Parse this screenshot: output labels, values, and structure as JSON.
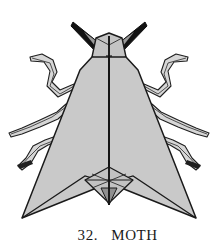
{
  "figure": {
    "title": "MOTH",
    "number": "32.",
    "caption_text": "32.   MOTH",
    "colors": {
      "wing_fill": "#c9c9c9",
      "body_fill": "#c4c4c4",
      "leg_fill": "#d4d4d4",
      "outline": "#1a1a1a",
      "antenna_fill": "#141414",
      "background": "#ffffff",
      "caption_color": "#1a1a1a"
    },
    "parts": [
      {
        "name": "left-antenna",
        "label": "Left antenna"
      },
      {
        "name": "right-antenna",
        "label": "Right antenna"
      },
      {
        "name": "head",
        "label": "Head"
      },
      {
        "name": "thorax",
        "label": "Thorax"
      },
      {
        "name": "left-wing",
        "label": "Left wing"
      },
      {
        "name": "right-wing",
        "label": "Right wing"
      },
      {
        "name": "center-spine",
        "label": "Center fold spine"
      },
      {
        "name": "abdomen-tail",
        "label": "Abdomen tail diamond"
      },
      {
        "name": "left-foreleg",
        "label": "Left foreleg"
      },
      {
        "name": "left-midleg",
        "label": "Left middle leg"
      },
      {
        "name": "left-hindleg",
        "label": "Left hind leg"
      },
      {
        "name": "right-foreleg",
        "label": "Right foreleg"
      },
      {
        "name": "right-midleg",
        "label": "Right middle leg"
      },
      {
        "name": "right-hindleg",
        "label": "Right hind leg"
      }
    ]
  }
}
